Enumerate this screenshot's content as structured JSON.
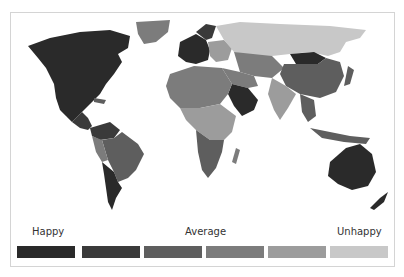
{
  "legend": {
    "labels": [
      {
        "text": "Happy",
        "x": 32
      },
      {
        "text": "Average",
        "x": 185
      },
      {
        "text": "Unhappy",
        "x": 337
      }
    ],
    "swatches": [
      {
        "level": 1,
        "color": "#2a2a2a",
        "x": 17
      },
      {
        "level": 2,
        "color": "#3a3a3a",
        "x": 82
      },
      {
        "level": 3,
        "color": "#5e5e5e",
        "x": 144
      },
      {
        "level": 4,
        "color": "#7c7c7c",
        "x": 206
      },
      {
        "level": 5,
        "color": "#9c9c9c",
        "x": 268
      },
      {
        "level": 6,
        "color": "#c8c8c8",
        "x": 330
      }
    ]
  },
  "regions": [
    {
      "name": "North America",
      "level": 1
    },
    {
      "name": "Greenland",
      "level": 4
    },
    {
      "name": "Central America",
      "level": 2
    },
    {
      "name": "South America North",
      "level": 2
    },
    {
      "name": "Brazil",
      "level": 3
    },
    {
      "name": "Argentina/Chile",
      "level": 1
    },
    {
      "name": "Western Europe",
      "level": 1
    },
    {
      "name": "Eastern Europe",
      "level": 5
    },
    {
      "name": "Russia",
      "level": 6
    },
    {
      "name": "Central Asia",
      "level": 4
    },
    {
      "name": "China",
      "level": 3
    },
    {
      "name": "Mongolia",
      "level": 1
    },
    {
      "name": "Arabian Peninsula",
      "level": 1
    },
    {
      "name": "India",
      "level": 5
    },
    {
      "name": "North Africa",
      "level": 4
    },
    {
      "name": "Central Africa",
      "level": 5
    },
    {
      "name": "Southern Africa",
      "level": 3
    },
    {
      "name": "Southeast Asia",
      "level": 3
    },
    {
      "name": "Australia",
      "level": 1
    },
    {
      "name": "New Zealand",
      "level": 1
    }
  ]
}
